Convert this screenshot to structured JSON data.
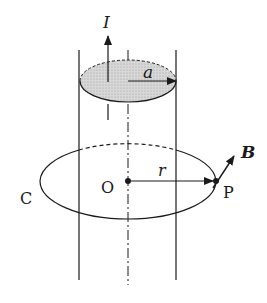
{
  "diagram": {
    "labels": {
      "current": "I",
      "radius_conductor": "a",
      "radius_path": "r",
      "center": "O",
      "point": "P",
      "field": "B",
      "path": "C"
    },
    "colors": {
      "stroke": "#1a1a1a",
      "cross_section_fill": "#d4d4d4",
      "background": "#ffffff"
    }
  }
}
